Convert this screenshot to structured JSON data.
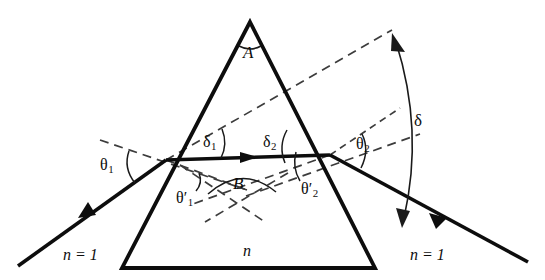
{
  "figure": {
    "type": "optics-diagram",
    "background_color": "#ffffff",
    "line_color": "#0d0d0d",
    "dash_color": "#3c3c3c"
  },
  "labels": {
    "apex_angle": "A",
    "internal_angle": "B",
    "prism_index": "n",
    "left_medium": "n = 1",
    "right_medium": "n = 1",
    "theta1": "θ",
    "theta1_sub": "1",
    "theta1_prime": "θ",
    "theta1_prime_sub": "1",
    "theta2": "θ",
    "theta2_sub": "2",
    "theta2_prime": "θ",
    "theta2_prime_sub": "2",
    "delta1": "δ",
    "delta1_sub": "1",
    "delta2": "δ",
    "delta2_sub": "2",
    "delta": "δ",
    "prime_mark": "′"
  },
  "geometry": {
    "prism": {
      "apex": [
        250,
        22
      ],
      "bottom_left": [
        122,
        268
      ],
      "bottom_right": [
        375,
        268
      ]
    },
    "entry_point": [
      166,
      160
    ],
    "exit_point": [
      330,
      155
    ],
    "incident_ray_start": [
      18,
      266
    ],
    "exit_ray_end": [
      528,
      262
    ],
    "incident_extension_end": [
      392,
      30
    ]
  },
  "annotations": {
    "incident_ray": "incoming light ray in medium n = 1",
    "internal_ray": "refracted ray inside prism of index n",
    "exit_ray": "emergent ray in medium n = 1",
    "deviation": "total angular deviation delta between incident extension and emergent ray"
  }
}
